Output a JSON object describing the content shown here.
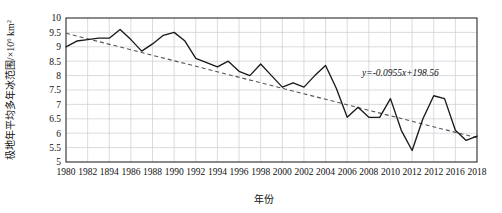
{
  "chart_data": {
    "type": "line",
    "title": "",
    "xlabel": "年份",
    "ylabel": "极地年平均多年冰范围/×10⁶ km²",
    "ylabel_main": "极地年平均多年冰范围/×10",
    "ylabel_exp": "6",
    "ylabel_unit": " km",
    "ylabel_unit_exp": "2",
    "xlim": [
      1980,
      2018
    ],
    "ylim": [
      5,
      10
    ],
    "grid": true,
    "legend": "none",
    "ytick_labels": [
      "10",
      "9.5",
      "9",
      "8.5",
      "8",
      "7.5",
      "7",
      "6.5",
      "6",
      "5.5",
      "5"
    ],
    "ytick_values": [
      10,
      9.5,
      9,
      8.5,
      8,
      7.5,
      7,
      6.5,
      6,
      5.5,
      5
    ],
    "xtick_labels": [
      "1980",
      "1982",
      "1894",
      "1986",
      "1988",
      "1990",
      "1992",
      "1994",
      "1996",
      "1998",
      "2000",
      "2002",
      "2004",
      "2006",
      "2008",
      "2010",
      "2012",
      "2012",
      "2016",
      "2018"
    ],
    "xtick_values": [
      1980,
      1982,
      1984,
      1986,
      1988,
      1990,
      1992,
      1994,
      1996,
      1998,
      2000,
      2002,
      2004,
      2006,
      2008,
      2010,
      2012,
      2014,
      2016,
      2018
    ],
    "series": [
      {
        "name": "极地年平均多年冰范围",
        "style": "solid",
        "color": "#1a1a1a",
        "x": [
          1980,
          1981,
          1982,
          1983,
          1984,
          1985,
          1986,
          1987,
          1988,
          1989,
          1990,
          1991,
          1992,
          1993,
          1994,
          1995,
          1996,
          1997,
          1998,
          1999,
          2000,
          2001,
          2002,
          2003,
          2004,
          2005,
          2006,
          2007,
          2008,
          2009,
          2010,
          2011,
          2012,
          2013,
          2014,
          2015,
          2016,
          2017,
          2018
        ],
        "values": [
          9.0,
          9.2,
          9.25,
          9.3,
          9.3,
          9.6,
          9.25,
          8.85,
          9.1,
          9.4,
          9.5,
          9.2,
          8.6,
          8.45,
          8.3,
          8.5,
          8.15,
          8.0,
          8.4,
          8.0,
          7.6,
          7.75,
          7.6,
          8.0,
          8.35,
          7.55,
          6.55,
          6.9,
          6.55,
          6.55,
          7.2,
          6.1,
          5.4,
          6.5,
          7.3,
          7.2,
          6.1,
          5.75,
          5.9
        ]
      }
    ],
    "trendline": {
      "name": "线性趋势线",
      "style": "dashed",
      "color": "#555555",
      "equation": "y=-0.0955x+198.56",
      "slope": -0.0955,
      "intercept": 198.56,
      "x_start": 1980,
      "x_end": 2018,
      "y_start": 9.47,
      "y_end": 5.84
    }
  }
}
